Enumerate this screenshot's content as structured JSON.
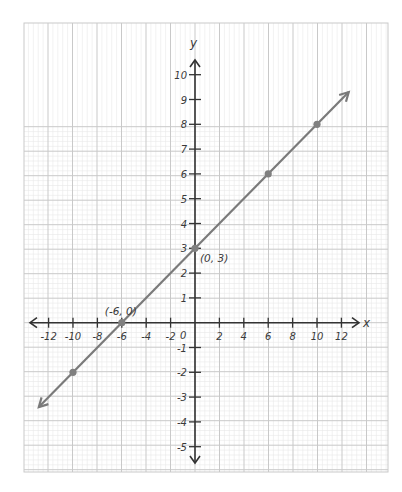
{
  "chart_data": {
    "type": "line",
    "title": "",
    "xlabel": "x",
    "ylabel": "y",
    "xlim": [
      -12,
      12
    ],
    "ylim": [
      -5,
      10
    ],
    "grid": true,
    "x_ticks": [
      -12,
      -10,
      -8,
      -6,
      -4,
      -2,
      2,
      4,
      6,
      8,
      10,
      12
    ],
    "x_tick_labels": [
      "-12",
      "-10",
      "-8",
      "-6",
      "-4",
      "-2",
      "2",
      "4",
      "6",
      "8",
      "10",
      "12"
    ],
    "y_ticks": [
      -5,
      -4,
      -3,
      -2,
      -1,
      1,
      2,
      3,
      4,
      5,
      6,
      7,
      8,
      9,
      10
    ],
    "y_tick_labels": [
      "-5",
      "-4",
      "-3",
      "-2",
      "-1",
      "1",
      "2",
      "3",
      "4",
      "5",
      "6",
      "7",
      "8",
      "9",
      "10"
    ],
    "origin_label": "0",
    "series": [
      {
        "name": "line",
        "equation": "y = x/2 + 3",
        "color": "#7a7a7a",
        "arrow_ends": [
          [
            -12.8,
            -3.4
          ],
          [
            12.6,
            9.3
          ]
        ],
        "points": [
          {
            "x": -10,
            "y": -2
          },
          {
            "x": -6,
            "y": 0
          },
          {
            "x": 0,
            "y": 3
          },
          {
            "x": 6,
            "y": 6
          },
          {
            "x": 10,
            "y": 8
          }
        ]
      }
    ],
    "annotations": [
      {
        "text": "(-6, 0)",
        "x": -6,
        "y": 0
      },
      {
        "text": "(0, 3)",
        "x": 0,
        "y": 3
      }
    ]
  },
  "colors": {
    "axis": "#333333",
    "major_grid": "#c9c9c9",
    "minor_grid": "#e8e8e8",
    "line": "#7a7a7a",
    "point": "#808080"
  }
}
